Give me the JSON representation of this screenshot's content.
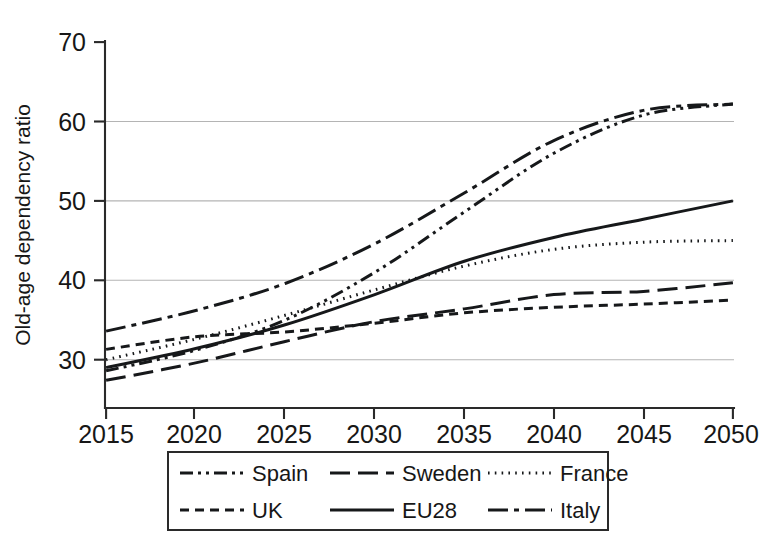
{
  "chart_data": {
    "type": "line",
    "title": "",
    "subtitle": "",
    "xlabel": "",
    "ylabel": "Old-age dependency ratio",
    "xlim": [
      2015,
      2050
    ],
    "ylim": [
      26,
      70
    ],
    "xticks": [
      2015,
      2020,
      2025,
      2030,
      2035,
      2040,
      2045,
      2050
    ],
    "xtick_labels": [
      "2015",
      "2020",
      "2025",
      "2030",
      "2035",
      "2040",
      "2045",
      "2050"
    ],
    "yticks": [
      30,
      40,
      50,
      60,
      70
    ],
    "ytick_labels": [
      "30",
      "40",
      "50",
      "60",
      "70"
    ],
    "gridlines_y": [
      30,
      40,
      50,
      60
    ],
    "grid": "horizontal-only",
    "legend_position": "below-axes",
    "legend_columns": 3,
    "x": [
      2015,
      2020,
      2025,
      2030,
      2035,
      2040,
      2045,
      2050
    ],
    "series": [
      {
        "name": "Spain",
        "dash_style": "dash-dot-dot",
        "color": "#16181a",
        "values": [
          28.6,
          31.2,
          35.0,
          41.0,
          48.6,
          56.0,
          60.8,
          62.2
        ]
      },
      {
        "name": "Sweden",
        "dash_style": "long-dash",
        "color": "#16181a",
        "values": [
          27.4,
          29.6,
          32.3,
          34.8,
          36.4,
          38.2,
          38.6,
          39.7
        ]
      },
      {
        "name": "France",
        "dash_style": "dotted",
        "color": "#16181a",
        "values": [
          30.0,
          32.6,
          35.6,
          38.8,
          41.8,
          43.9,
          44.8,
          45.0
        ]
      },
      {
        "name": "UK",
        "dash_style": "short-dash",
        "color": "#16181a",
        "values": [
          31.3,
          32.9,
          33.5,
          34.6,
          35.9,
          36.6,
          37.0,
          37.5
        ]
      },
      {
        "name": "EU28",
        "dash_style": "solid",
        "color": "#16181a",
        "values": [
          29.0,
          31.4,
          34.4,
          38.2,
          42.4,
          45.4,
          47.7,
          50.0
        ]
      },
      {
        "name": "Italy",
        "dash_style": "dash-dot",
        "color": "#16181a",
        "values": [
          33.6,
          36.2,
          39.6,
          44.6,
          51.0,
          57.6,
          61.4,
          62.2
        ]
      }
    ]
  },
  "legend": {
    "entries": [
      {
        "label": "Spain"
      },
      {
        "label": "Sweden"
      },
      {
        "label": "France"
      },
      {
        "label": "UK"
      },
      {
        "label": "EU28"
      },
      {
        "label": "Italy"
      }
    ]
  },
  "axes": {
    "y_title": "Old-age dependency ratio"
  }
}
